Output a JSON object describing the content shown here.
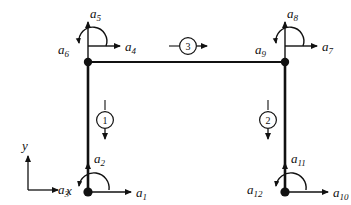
{
  "figure": {
    "type": "structural-frame-dof-diagram",
    "line_color": "#111111",
    "node_color": "#111111",
    "background": "#ffffff"
  },
  "axes": {
    "x_label": "x",
    "y_label": "y",
    "origin": {
      "x": 28,
      "y": 190
    },
    "x_tip": {
      "x": 62,
      "y": 190
    },
    "y_tip": {
      "x": 28,
      "y": 152
    }
  },
  "nodes": [
    {
      "id": "node-top-left",
      "x": 88,
      "y": 62
    },
    {
      "id": "node-top-right",
      "x": 285,
      "y": 62
    },
    {
      "id": "node-bottom-left",
      "x": 88,
      "y": 192
    },
    {
      "id": "node-bottom-right",
      "x": 285,
      "y": 192
    }
  ],
  "members": [
    {
      "id": "member-left-column",
      "from": "node-bottom-left",
      "to": "node-top-left"
    },
    {
      "id": "member-right-column",
      "from": "node-bottom-right",
      "to": "node-top-right"
    },
    {
      "id": "member-top-beam",
      "from": "node-top-left",
      "to": "node-top-right"
    }
  ],
  "elements": [
    {
      "id": "element-1",
      "label": "1",
      "cx": 105,
      "cy": 120,
      "orientation": "vertical-down"
    },
    {
      "id": "element-2",
      "label": "2",
      "cx": 268,
      "cy": 120,
      "orientation": "vertical-down"
    },
    {
      "id": "element-3",
      "label": "3",
      "cx": 188,
      "cy": 46,
      "orientation": "horizontal-right"
    }
  ],
  "dofs": [
    {
      "id": "dof-a1",
      "name": "a",
      "sub": "1",
      "kind": "translation",
      "direction": "right",
      "node": "node-bottom-left",
      "label_x": 138,
      "label_y": 196
    },
    {
      "id": "dof-a2",
      "name": "a",
      "sub": "2",
      "kind": "translation",
      "direction": "up",
      "node": "node-bottom-left",
      "label_x": 96,
      "label_y": 162
    },
    {
      "id": "dof-a3",
      "name": "a",
      "sub": "3",
      "kind": "rotation",
      "direction": "ccw",
      "node": "node-bottom-left",
      "label_x": 62,
      "label_y": 192
    },
    {
      "id": "dof-a4",
      "name": "a",
      "sub": "4",
      "kind": "translation",
      "direction": "right",
      "node": "node-top-left",
      "label_x": 126,
      "label_y": 50
    },
    {
      "id": "dof-a5",
      "name": "a",
      "sub": "5",
      "kind": "translation",
      "direction": "up",
      "node": "node-top-left",
      "label_x": 92,
      "label_y": 17
    },
    {
      "id": "dof-a6",
      "name": "a",
      "sub": "6",
      "kind": "rotation",
      "direction": "ccw",
      "node": "node-top-left",
      "label_x": 62,
      "label_y": 52
    },
    {
      "id": "dof-a7",
      "name": "a",
      "sub": "7",
      "kind": "translation",
      "direction": "right",
      "node": "node-top-right",
      "label_x": 322,
      "label_y": 50
    },
    {
      "id": "dof-a8",
      "name": "a",
      "sub": "8",
      "kind": "translation",
      "direction": "up",
      "node": "node-top-right",
      "label_x": 289,
      "label_y": 17
    },
    {
      "id": "dof-a9",
      "name": "a",
      "sub": "9",
      "kind": "rotation",
      "direction": "ccw",
      "node": "node-top-right",
      "label_x": 259,
      "label_y": 52
    },
    {
      "id": "dof-a10",
      "name": "a",
      "sub": "10",
      "kind": "translation",
      "direction": "right",
      "node": "node-bottom-right",
      "label_x": 334,
      "label_y": 196
    },
    {
      "id": "dof-a11",
      "name": "a",
      "sub": "11",
      "kind": "translation",
      "direction": "up",
      "node": "node-bottom-right",
      "label_x": 293,
      "label_y": 162
    },
    {
      "id": "dof-a12",
      "name": "a",
      "sub": "12",
      "kind": "rotation",
      "direction": "ccw",
      "node": "node-bottom-right",
      "label_x": 253,
      "label_y": 192
    }
  ]
}
